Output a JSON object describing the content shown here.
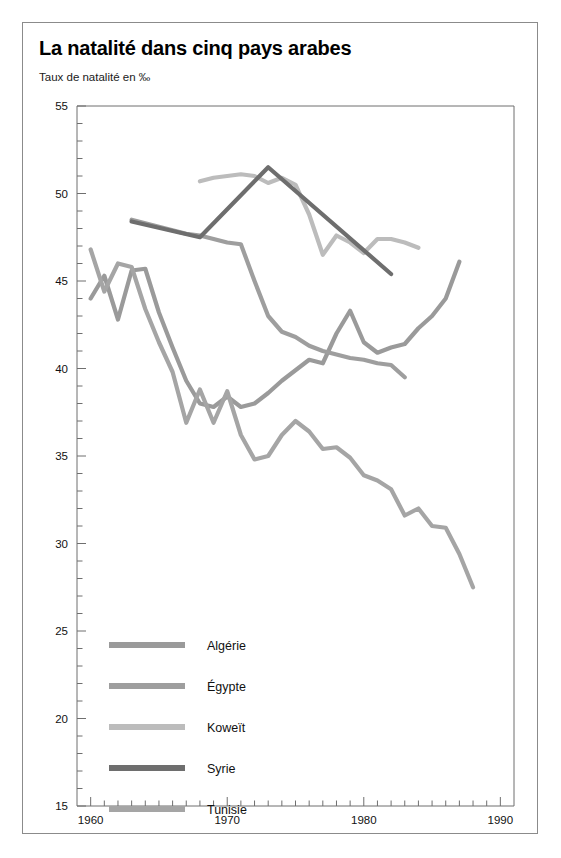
{
  "figure": {
    "title": "La natalité dans cinq pays arabes",
    "subtitle": "Taux de natalité en ‰"
  },
  "chart_data": {
    "type": "line",
    "title": "La natalité dans cinq pays arabes",
    "subtitle": "Taux de natalité en ‰",
    "xlabel": "",
    "ylabel": "Taux de natalité en ‰",
    "xlim": [
      1959,
      1991
    ],
    "ylim": [
      15,
      55
    ],
    "xticks_major": [
      1960,
      1970,
      1980,
      1990
    ],
    "xticks_minor_step": 1,
    "yticks_major": [
      15,
      20,
      25,
      30,
      35,
      40,
      45,
      50,
      55
    ],
    "yticks_minor_step": 1,
    "grid": false,
    "legend_position": "inside-bottom-left",
    "series": [
      {
        "name": "Algérie",
        "color": "#9a9a9a",
        "x": [
          1960,
          1961,
          1962,
          1963,
          1964,
          1965,
          1966,
          1967,
          1968,
          1969,
          1970,
          1971,
          1972,
          1973,
          1974,
          1975,
          1976,
          1977,
          1978,
          1979,
          1980,
          1981,
          1982,
          1983,
          1984,
          1985,
          1986,
          1987
        ],
        "y": [
          44.0,
          45.3,
          42.8,
          45.6,
          45.7,
          43.2,
          41.2,
          39.3,
          38.0,
          37.8,
          38.4,
          37.8,
          38.0,
          38.6,
          39.3,
          39.9,
          40.5,
          40.3,
          42.0,
          43.3,
          41.5,
          40.9,
          41.2,
          41.4,
          42.3,
          43.0,
          44.0,
          46.1
        ]
      },
      {
        "name": "Égypte",
        "color": "#9e9e9e",
        "x": [
          1963,
          1964,
          1965,
          1966,
          1967,
          1968,
          1969,
          1970,
          1971,
          1972,
          1973,
          1974,
          1975,
          1976,
          1977,
          1978,
          1979,
          1980,
          1981,
          1982,
          1983
        ],
        "y": [
          48.5,
          48.3,
          48.1,
          47.9,
          47.7,
          47.6,
          47.4,
          47.2,
          47.1,
          45.0,
          43.0,
          42.1,
          41.8,
          41.3,
          41.0,
          40.8,
          40.6,
          40.5,
          40.3,
          40.2,
          39.5
        ]
      },
      {
        "name": "Koweït",
        "color": "#bcbcbc",
        "x": [
          1968,
          1969,
          1970,
          1971,
          1972,
          1973,
          1974,
          1975,
          1976,
          1977,
          1978,
          1979,
          1980,
          1981,
          1982,
          1983,
          1984
        ],
        "y": [
          50.7,
          50.9,
          51.0,
          51.1,
          51.0,
          50.6,
          50.9,
          50.5,
          48.8,
          46.5,
          47.6,
          47.2,
          46.6,
          47.4,
          47.4,
          47.2,
          46.9
        ]
      },
      {
        "name": "Syrie",
        "color": "#6e6e6e",
        "x": [
          1963,
          1968,
          1973,
          1982
        ],
        "y": [
          48.4,
          47.5,
          51.5,
          45.4
        ]
      },
      {
        "name": "Tunisie",
        "color": "#a5a5a5",
        "x": [
          1960,
          1961,
          1962,
          1963,
          1964,
          1965,
          1966,
          1967,
          1968,
          1969,
          1970,
          1971,
          1972,
          1973,
          1974,
          1975,
          1976,
          1977,
          1978,
          1979,
          1980,
          1981,
          1982,
          1983,
          1984,
          1985,
          1986,
          1987,
          1988
        ],
        "y": [
          46.8,
          44.4,
          46.0,
          45.8,
          43.4,
          41.5,
          39.8,
          36.9,
          38.8,
          36.9,
          38.7,
          36.2,
          34.8,
          35.0,
          36.2,
          37.0,
          36.4,
          35.4,
          35.5,
          34.9,
          33.9,
          33.6,
          33.1,
          31.6,
          32.0,
          31.0,
          30.9,
          29.4,
          27.5
        ]
      }
    ]
  },
  "legend": {
    "items": [
      {
        "label": "Algérie",
        "color": "#9a9a9a"
      },
      {
        "label": "Égypte",
        "color": "#9e9e9e"
      },
      {
        "label": "Koweït",
        "color": "#bcbcbc"
      },
      {
        "label": "Syrie",
        "color": "#6e6e6e"
      },
      {
        "label": "Tunisie",
        "color": "#a5a5a5"
      }
    ]
  }
}
